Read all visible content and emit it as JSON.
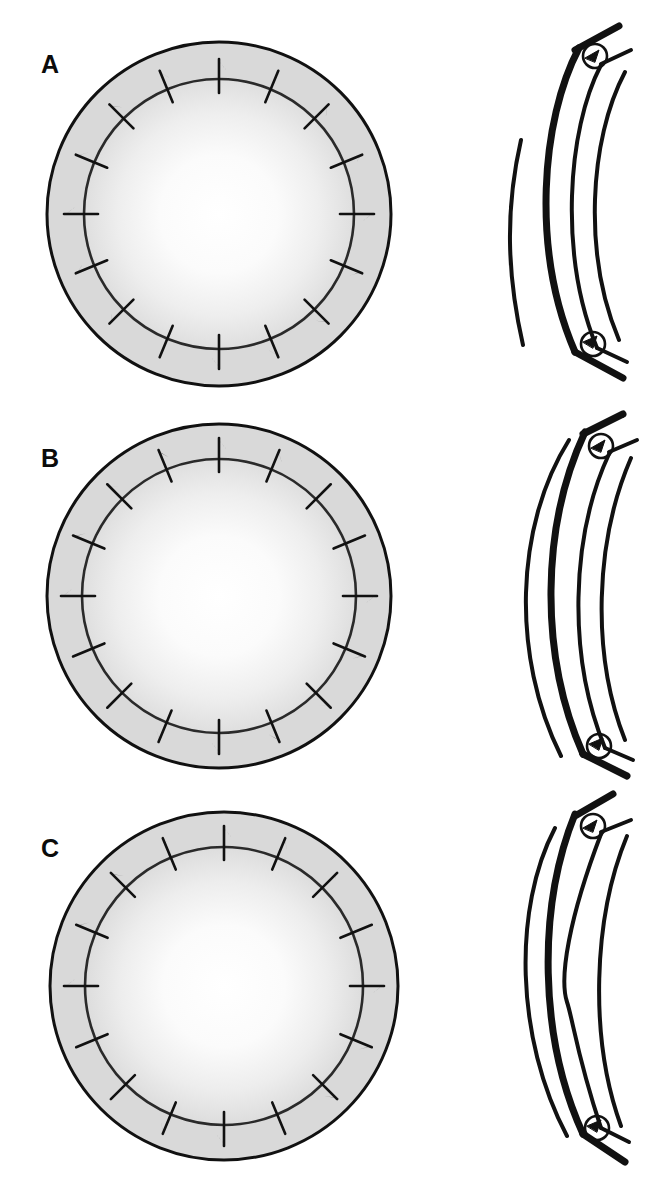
{
  "figure": {
    "background_color": "#ffffff",
    "line_color": "#111111",
    "ring_fill_color": "#d9d9d9",
    "inner_fill_center_color": "#ffffff",
    "inner_fill_edge_color": "#dedede",
    "label_color": "#0b0b0b"
  },
  "panels": [
    {
      "id": "A",
      "label": "A",
      "enface": {
        "name": "graft-enface-view-a",
        "center_x": 219,
        "center_y": 214,
        "outer_radius": 172,
        "inner_radius": 135,
        "suture_count": 16,
        "suture_inner_extent": 14,
        "suture_outer_extent": 20,
        "suture_start_angle_deg": -90,
        "knot_side": "outer"
      },
      "section": {
        "name": "graft-cross-section-view-a",
        "description": "Cross-section with thick host cornea arcs, graft lenticule between, and two suture knot loops at the graft-host junctions",
        "knot_count": 2,
        "knot_positions": [
          "superior",
          "inferior"
        ],
        "graft_thickness": "thick",
        "tail_angle": "oblique"
      }
    },
    {
      "id": "B",
      "label": "B",
      "enface": {
        "name": "graft-enface-view-b",
        "center_x": 219,
        "center_y": 200,
        "outer_radius": 172,
        "inner_radius": 137,
        "suture_count": 16,
        "suture_inner_extent": 13,
        "suture_outer_extent": 21,
        "suture_start_angle_deg": -90,
        "knot_side": "outer"
      },
      "section": {
        "name": "graft-cross-section-view-b",
        "description": "Cross-section with slender, deeply curved arcs and two suture knot loops at the graft-host junctions",
        "knot_count": 2,
        "knot_positions": [
          "superior",
          "inferior"
        ],
        "graft_thickness": "thin",
        "tail_angle": "oblique"
      }
    },
    {
      "id": "C",
      "label": "C",
      "enface": {
        "name": "graft-enface-view-c",
        "center_x": 224,
        "center_y": 198,
        "outer_radius": 174,
        "inner_radius": 139,
        "suture_count": 16,
        "suture_inner_extent": 13,
        "suture_outer_extent": 21,
        "suture_start_angle_deg": -90,
        "knot_side": "outer"
      },
      "section": {
        "name": "graft-cross-section-view-c",
        "description": "Cross-section with an irregular inner arc contour and two suture knot loops at the graft-host junctions",
        "knot_count": 2,
        "knot_positions": [
          "superior",
          "inferior"
        ],
        "graft_thickness": "thick",
        "tail_angle": "oblique"
      }
    }
  ]
}
